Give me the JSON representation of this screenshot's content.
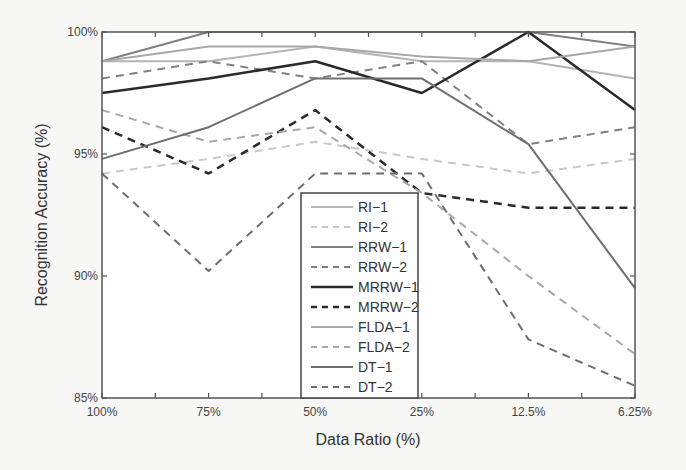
{
  "chart_data": {
    "type": "line",
    "title": "",
    "xlabel": "Data Ratio (%)",
    "ylabel": "Recognition Accuracy (%)",
    "categories": [
      "100%",
      "75%",
      "50%",
      "25%",
      "12.5%",
      "6.25%"
    ],
    "yticks": [
      "85%",
      "90%",
      "95%",
      "100%"
    ],
    "ytick_values": [
      85,
      90,
      95,
      100
    ],
    "ylim": [
      85,
      100
    ],
    "grid": false,
    "legend_position": "inside-center-bottom",
    "series": [
      {
        "name": "RI−1",
        "values": [
          98.8,
          98.8,
          99.4,
          98.8,
          98.8,
          98.1
        ],
        "color": "#b4b4b4",
        "dash": "solid",
        "width": 2
      },
      {
        "name": "RI−2",
        "values": [
          94.2,
          94.8,
          95.5,
          94.8,
          94.2,
          94.8
        ],
        "color": "#c8c8c8",
        "dash": "dashed",
        "width": 2
      },
      {
        "name": "RRW−1",
        "values": [
          98.8,
          100,
          100,
          100,
          100,
          99.4
        ],
        "color": "#808080",
        "dash": "solid",
        "width": 2
      },
      {
        "name": "RRW−2",
        "values": [
          98.1,
          98.8,
          98.1,
          98.8,
          95.4,
          96.1
        ],
        "color": "#808080",
        "dash": "dashed",
        "width": 2
      },
      {
        "name": "MRRW−1",
        "values": [
          97.5,
          98.1,
          98.8,
          97.5,
          100,
          96.8
        ],
        "color": "#2a2a2a",
        "dash": "solid",
        "width": 2.5
      },
      {
        "name": "MRRW−2",
        "values": [
          96.1,
          94.2,
          96.8,
          93.4,
          92.8,
          92.8
        ],
        "color": "#2a2a2a",
        "dash": "dashed",
        "width": 2.5
      },
      {
        "name": "FLDA−1",
        "values": [
          98.8,
          99.4,
          99.4,
          99.0,
          98.8,
          99.4
        ],
        "color": "#a8a8a8",
        "dash": "solid",
        "width": 2
      },
      {
        "name": "FLDA−2",
        "values": [
          96.8,
          95.5,
          96.1,
          93.4,
          90.0,
          86.8
        ],
        "color": "#a8a8a8",
        "dash": "dashed",
        "width": 2
      },
      {
        "name": "DT−1",
        "values": [
          94.8,
          96.1,
          98.1,
          98.1,
          95.4,
          89.5
        ],
        "color": "#6e6e6e",
        "dash": "solid",
        "width": 2
      },
      {
        "name": "DT−2",
        "values": [
          94.2,
          90.2,
          94.2,
          94.2,
          87.4,
          85.5
        ],
        "color": "#6e6e6e",
        "dash": "dashed",
        "width": 2
      }
    ]
  },
  "layout": {
    "plot": {
      "left": 102,
      "top": 32,
      "right": 635,
      "bottom": 398
    },
    "legend": {
      "left": 301,
      "top": 193,
      "width": 117,
      "height": 205
    }
  }
}
